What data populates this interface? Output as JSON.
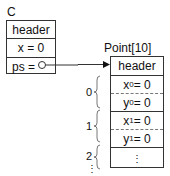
{
  "top_fragment": "...",
  "object_c": {
    "label": "C",
    "fields": [
      "header",
      "x = 0",
      "ps = "
    ]
  },
  "array": {
    "label": "Point[10]",
    "header": "header",
    "elements": [
      {
        "index": "0",
        "fields": [
          {
            "name": "x",
            "sub": "0",
            "val": " = 0"
          },
          {
            "name": "y",
            "sub": "0",
            "val": " = 0"
          }
        ]
      },
      {
        "index": "1",
        "fields": [
          {
            "name": "x",
            "sub": "1",
            "val": " = 0"
          },
          {
            "name": "y",
            "sub": "1",
            "val": " = 0"
          }
        ]
      },
      {
        "index": "2",
        "fields": [
          {
            "ellipsis": "⋮"
          }
        ]
      }
    ],
    "more": "⋮"
  }
}
